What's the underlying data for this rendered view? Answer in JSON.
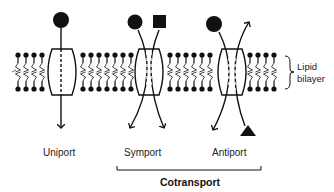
{
  "figure": {
    "transporters": [
      {
        "id": "uniport",
        "label": "Uniport",
        "solutes": [
          "circle"
        ],
        "direction": "same"
      },
      {
        "id": "symport",
        "label": "Symport",
        "solutes": [
          "circle",
          "square"
        ],
        "direction": "same"
      },
      {
        "id": "antiport",
        "label": "Antiport",
        "solutes": [
          "circle",
          "triangle"
        ],
        "direction": "opposite"
      }
    ],
    "membrane_label_line1": "Lipid",
    "membrane_label_line2": "bilayer",
    "group_label": "Cotransport",
    "colors": {
      "ink": "#111111",
      "background": "#ffffff"
    }
  }
}
